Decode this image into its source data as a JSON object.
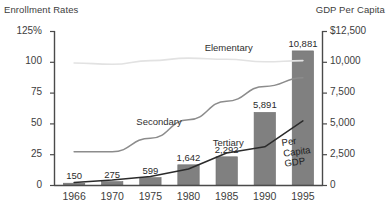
{
  "axis_captions": {
    "left": "Enrollment Rates",
    "right": "GDP Per Capita"
  },
  "chart_data": {
    "type": "bar",
    "title": "",
    "xlabel": "",
    "ylabel": "Enrollment Rates",
    "y2label": "GDP Per Capita",
    "grid": false,
    "legend": "inline-labels",
    "categories": [
      "1966",
      "1970",
      "1975",
      "1980",
      "1985",
      "1990",
      "1995"
    ],
    "ylim": [
      0,
      125
    ],
    "y2lim": [
      0,
      12500
    ],
    "yticks": [
      "125%",
      "100",
      "75",
      "50",
      "25",
      "0"
    ],
    "ytick_values": [
      125,
      100,
      75,
      50,
      25,
      0
    ],
    "y2ticks": [
      "$12,500",
      "10,000",
      "7,500",
      "5,000",
      "2,500",
      "0"
    ],
    "y2tick_values": [
      12500,
      10000,
      7500,
      5000,
      2500,
      0
    ],
    "bars": {
      "name": "Per Capita GDP",
      "axis": "right",
      "color": "#808080",
      "values": [
        150,
        275,
        599,
        1642,
        2292,
        5891,
        10881
      ],
      "labels": [
        "150",
        "275",
        "599",
        "1,642",
        "2,292",
        "5,891",
        "10,881"
      ]
    },
    "series": [
      {
        "name": "Elementary",
        "axis": "left",
        "color": "#e2e2e2",
        "values": [
          99,
          98,
          101,
          103,
          102,
          100,
          101
        ]
      },
      {
        "name": "Secondary",
        "axis": "left",
        "color": "#8c8c8c",
        "values": [
          27,
          27,
          38,
          53,
          68,
          80,
          87
        ]
      },
      {
        "name": "Tertiary",
        "axis": "left",
        "color": "#2b2b2b",
        "values": [
          2,
          4,
          7,
          13,
          26,
          31,
          52
        ]
      }
    ],
    "annotations": [
      {
        "text": "Elementary",
        "series": "Elementary"
      },
      {
        "text": "Secondary",
        "series": "Secondary"
      },
      {
        "text": "Tertiary",
        "series": "Tertiary"
      },
      {
        "text": "Per Capita GDP",
        "series": "Per Capita GDP"
      }
    ]
  }
}
